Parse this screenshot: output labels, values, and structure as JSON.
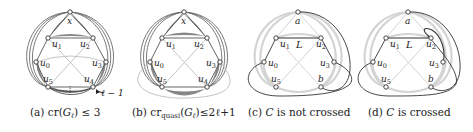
{
  "figure": {
    "panels": [
      {
        "id": "a",
        "caption_prefix": "(a) ",
        "caption_math": "cr(Gℓ) ≤ 3",
        "caption_parts": [
          "(a) ",
          "cr(",
          "G",
          "ℓ",
          ") ≤ 3"
        ],
        "nodes": [
          {
            "label": "x",
            "x": 70,
            "y": 12
          },
          {
            "label": "u1",
            "x": 48,
            "y": 38
          },
          {
            "label": "u2",
            "x": 93,
            "y": 38
          },
          {
            "label": "u0",
            "x": 36,
            "y": 62
          },
          {
            "label": "u3",
            "x": 106,
            "y": 62
          },
          {
            "label": "u5",
            "x": 48,
            "y": 87
          },
          {
            "label": "u4",
            "x": 93,
            "y": 87
          }
        ],
        "annotation": "ℓ − 1"
      },
      {
        "id": "b",
        "caption_parts": [
          "(b) ",
          "cr",
          "quasi",
          "(",
          "G",
          "ℓ",
          ")≤2ℓ+1"
        ],
        "nodes": [
          {
            "label": "x",
            "x": 184,
            "y": 12
          },
          {
            "label": "u1",
            "x": 162,
            "y": 38
          },
          {
            "label": "u2",
            "x": 207,
            "y": 38
          },
          {
            "label": "u0",
            "x": 150,
            "y": 62
          },
          {
            "label": "u3",
            "x": 220,
            "y": 62
          },
          {
            "label": "u5",
            "x": 162,
            "y": 87
          },
          {
            "label": "u4",
            "x": 207,
            "y": 87
          }
        ]
      },
      {
        "id": "c",
        "caption_parts": [
          "(c) ",
          "C",
          " is not crossed"
        ],
        "nodes": [
          {
            "label": "a",
            "x": 298,
            "y": 12
          },
          {
            "label": "u1",
            "x": 276,
            "y": 38
          },
          {
            "label": "u2",
            "x": 321,
            "y": 38
          },
          {
            "label": "u0",
            "x": 264,
            "y": 62
          },
          {
            "label": "u3",
            "x": 334,
            "y": 62
          },
          {
            "label": "u5",
            "x": 276,
            "y": 87
          },
          {
            "label": "b",
            "x": 321,
            "y": 87
          }
        ],
        "edge_label": "L"
      },
      {
        "id": "d",
        "caption_parts": [
          "(d) ",
          "C",
          " is crossed"
        ],
        "nodes": [
          {
            "label": "a",
            "x": 408,
            "y": 12
          },
          {
            "label": "u1",
            "x": 386,
            "y": 38
          },
          {
            "label": "u2",
            "x": 431,
            "y": 38
          },
          {
            "label": "u0",
            "x": 373,
            "y": 62
          },
          {
            "label": "u3",
            "x": 443,
            "y": 62
          },
          {
            "label": "u5",
            "x": 386,
            "y": 87
          },
          {
            "label": "b",
            "x": 431,
            "y": 87
          }
        ],
        "edge_label": "L"
      }
    ],
    "colors": {
      "dark_edge": "#555555",
      "gray_edge": "#9a9a9a",
      "light_edge": "#cfcfcf",
      "bundle_fill": "#7a7a7a",
      "text": "#222222"
    }
  }
}
